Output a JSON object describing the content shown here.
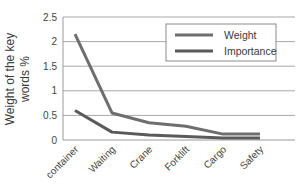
{
  "chart_data": {
    "type": "line",
    "title": "",
    "xlabel": "",
    "ylabel": "Weight of the key words %",
    "ylim": [
      0,
      2.5
    ],
    "yticks": [
      "0",
      "0.5",
      "1",
      "1.5",
      "2",
      "2.5"
    ],
    "grid": true,
    "legend_position": "upper right (inside)",
    "categories": [
      "container",
      "Waiting",
      "Crane",
      "Forklift",
      "Cargo",
      "Safety"
    ],
    "series": [
      {
        "name": "Weight",
        "color": "#6e6e6e",
        "values": [
          2.15,
          0.55,
          0.35,
          0.28,
          0.12,
          0.12
        ]
      },
      {
        "name": "Importance",
        "color": "#5a5a5a",
        "values": [
          0.6,
          0.16,
          0.1,
          0.07,
          0.04,
          0.04
        ]
      }
    ]
  },
  "axis": {
    "ylabel_line1": "Weight of the  key",
    "ylabel_line2": "words %"
  },
  "legend": {
    "items": [
      {
        "label": "Weight"
      },
      {
        "label": "Importance"
      }
    ]
  }
}
